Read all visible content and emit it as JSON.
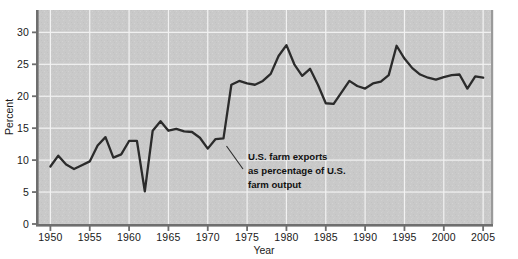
{
  "chart_data": {
    "type": "line",
    "title": "",
    "subtitle": "",
    "xlabel": "Year",
    "ylabel": "Percent",
    "xlim": [
      1948.5,
      2006.0
    ],
    "ylim": [
      0,
      33.5
    ],
    "grid": true,
    "legend_position": "none",
    "xticks": [
      1950,
      1955,
      1960,
      1965,
      1970,
      1975,
      1980,
      1985,
      1990,
      1995,
      2000,
      2005
    ],
    "xtick_labels": [
      "1950",
      "1955",
      "1960",
      "1965",
      "1970",
      "1975",
      "1980",
      "1985",
      "1990",
      "1995",
      "2000",
      "2005"
    ],
    "yticks": [
      0,
      5,
      10,
      15,
      20,
      25,
      30
    ],
    "ytick_labels": [
      "0",
      "5",
      "10",
      "15",
      "20",
      "25",
      "30"
    ],
    "annotations": [
      {
        "name": "series-callout",
        "lines": [
          "U.S. farm exports",
          "as percentage of U.S.",
          "farm output"
        ],
        "points_to_year": 1972,
        "points_to_value": 13.0
      }
    ],
    "series": [
      {
        "name": "U.S. farm exports as percentage of U.S. farm output",
        "color": "#2b2b2b",
        "x": [
          1950,
          1951,
          1952,
          1953,
          1954,
          1955,
          1956,
          1957,
          1958,
          1959,
          1960,
          1961,
          1962,
          1963,
          1964,
          1965,
          1966,
          1967,
          1968,
          1969,
          1970,
          1971,
          1972,
          1973,
          1974,
          1975,
          1976,
          1977,
          1978,
          1979,
          1980,
          1981,
          1982,
          1983,
          1984,
          1985,
          1986,
          1987,
          1988,
          1989,
          1990,
          1991,
          1992,
          1993,
          1994,
          1995,
          1996,
          1997,
          1998,
          1999,
          2000,
          2001,
          2002,
          2003,
          2004,
          2005
        ],
        "values": [
          9.0,
          10.7,
          9.3,
          8.6,
          9.2,
          9.8,
          12.3,
          13.6,
          10.4,
          10.9,
          13.0,
          13.0,
          5.1,
          14.6,
          16.1,
          14.6,
          14.9,
          14.5,
          14.4,
          13.5,
          11.8,
          13.3,
          13.4,
          21.8,
          22.4,
          22.0,
          21.8,
          22.4,
          23.5,
          26.3,
          28.0,
          25.0,
          23.2,
          24.3,
          21.8,
          18.9,
          18.8,
          20.6,
          22.4,
          21.6,
          21.2,
          22.0,
          22.3,
          23.3,
          27.9,
          25.9,
          24.4,
          23.4,
          22.9,
          22.6,
          23.0,
          23.3,
          23.4,
          21.2,
          23.1,
          22.9
        ]
      }
    ]
  },
  "axes": {
    "ylabel": "Percent",
    "xlabel": "Year"
  },
  "colors": {
    "plot_background": "#c9c9c9",
    "gridline": "#f2f2f2",
    "line": "#2b2b2b",
    "axis": "#6e6e6e",
    "text": "#1a1a1a"
  }
}
